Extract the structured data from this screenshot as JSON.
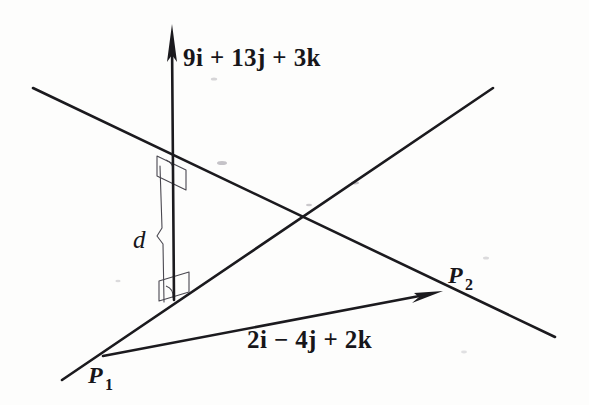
{
  "figure": {
    "background_color": "#fdfdfc",
    "ink_color": "#1b1a1e",
    "thin_ink_color": "#4a4850",
    "width": 589,
    "height": 405
  },
  "labels": {
    "normal_vector": "9i + 13j + 3k",
    "direction_vector": "2i − 4j + 2k",
    "distance": "d",
    "point_1_base": "P",
    "point_1_sub": "1",
    "point_2_base": "P",
    "point_2_sub": "2"
  },
  "geometry": {
    "upper_line": {
      "x1": 33,
      "y1": 88,
      "x2": 555,
      "y2": 337,
      "width": 2.6
    },
    "lower_line": {
      "x1": 62,
      "y1": 380,
      "x2": 493,
      "y2": 88,
      "width": 2.6
    },
    "vector_arrow_vertical": {
      "x1": 174,
      "y1": 300,
      "x2": 172,
      "y2": 26,
      "width": 2.6
    },
    "vector_arrow_p1p2": {
      "x1": 103,
      "y1": 356,
      "x2": 443,
      "y2": 291,
      "width": 2.6
    },
    "distance_segment": {
      "x1": 161,
      "y1": 168,
      "x2": 166,
      "y2": 300,
      "width": 1.1
    },
    "crossing_point": {
      "x": 305,
      "y": 212
    },
    "right_angle_top": {
      "x": 155,
      "y": 155
    },
    "right_angle_bottom": {
      "x": 157,
      "y": 276
    },
    "label_positions": {
      "normal_vector": {
        "x": 183,
        "y": 66
      },
      "direction_vector": {
        "x": 247,
        "y": 348
      },
      "distance": {
        "x": 133,
        "y": 248
      },
      "point_1": {
        "x": 88,
        "y": 383
      },
      "point_2": {
        "x": 448,
        "y": 283
      }
    }
  },
  "math": {
    "normal_vector_components": [
      9,
      13,
      3
    ],
    "direction_vector_components": [
      2,
      -4,
      2
    ],
    "distance_symbol": "d"
  }
}
